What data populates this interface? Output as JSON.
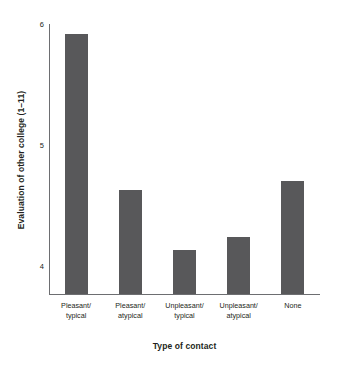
{
  "chart_data": {
    "type": "bar",
    "title": "",
    "xlabel": "Type of contact",
    "ylabel": "Evaluation of other college (1–11)",
    "categories": [
      "Pleasant/\ntypical",
      "Pleasant/\natypical",
      "Unpleasant/\ntypical",
      "Unpleasant/\natypical",
      "None"
    ],
    "category_lines": [
      [
        "Pleasant/",
        "typical"
      ],
      [
        "Pleasant/",
        "atypical"
      ],
      [
        "Unpleasant/",
        "typical"
      ],
      [
        "Unpleasant/",
        "atypical"
      ],
      [
        "None",
        ""
      ]
    ],
    "values": [
      5.92,
      4.63,
      4.13,
      4.24,
      4.7
    ],
    "ylim": [
      3.76,
      6.0
    ],
    "yticks": [
      4,
      5,
      6
    ],
    "ytick_labels": [
      "4",
      "5",
      "6"
    ],
    "grid": false,
    "legend": false,
    "bar_color": "#58585a",
    "axis_color": "#6d6e71",
    "background": "#ffffff"
  }
}
